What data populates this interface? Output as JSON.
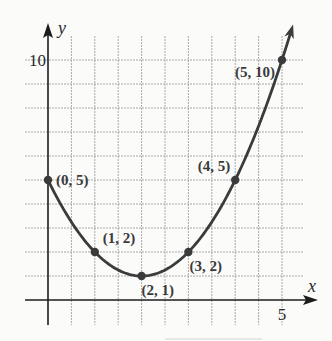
{
  "chart_data": {
    "type": "line",
    "title": "",
    "xlabel": "x",
    "ylabel": "y",
    "xlim": [
      -0.5,
      5.5
    ],
    "ylim": [
      -1,
      11
    ],
    "x_grid_step": 0.5,
    "y_grid_step": 1,
    "grid": true,
    "x_ticks": [
      {
        "value": 5,
        "label": "5"
      }
    ],
    "y_ticks": [
      {
        "value": 10,
        "label": "10"
      }
    ],
    "series": [
      {
        "name": "parabola",
        "points": [
          {
            "x": 0,
            "y": 5,
            "label": "(0, 5)"
          },
          {
            "x": 1,
            "y": 2,
            "label": "(1, 2)"
          },
          {
            "x": 2,
            "y": 1,
            "label": "(2, 1)"
          },
          {
            "x": 3,
            "y": 2,
            "label": "(3, 2)"
          },
          {
            "x": 4,
            "y": 5,
            "label": "(4, 5)"
          },
          {
            "x": 5,
            "y": 10,
            "label": "(5, 10)"
          }
        ],
        "curve_extends_to_x": 5.2,
        "arrow_at_end": true
      }
    ],
    "colors": {
      "curve": "#3b3b3b",
      "axis": "#1c1c1c",
      "grid": "#a9a9a9",
      "background": "#fbfbfa"
    }
  }
}
